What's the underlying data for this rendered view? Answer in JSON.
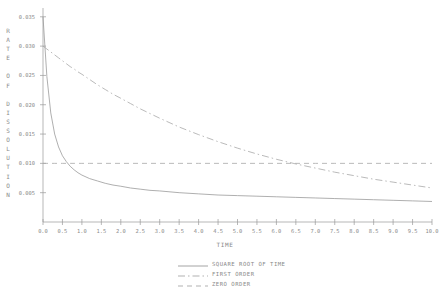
{
  "chart_data": {
    "type": "line",
    "title": "",
    "xlabel": "TIME",
    "ylabel": "RATE OF DISSOLUTION",
    "xlim": [
      0.0,
      10.0
    ],
    "ylim": [
      0.0,
      0.035
    ],
    "grid": false,
    "legend_position": "bottom-center",
    "xticks": [
      "0.0",
      "0.5",
      "1.0",
      "1.5",
      "2.0",
      "2.5",
      "3.0",
      "3.5",
      "4.0",
      "4.5",
      "5.0",
      "5.5",
      "6.0",
      "6.5",
      "7.0",
      "7.5",
      "8.0",
      "8.5",
      "9.0",
      "9.5",
      "10.0"
    ],
    "xtick_values": [
      0,
      0.5,
      1,
      1.5,
      2,
      2.5,
      3,
      3.5,
      4,
      4.5,
      5,
      5.5,
      6,
      6.5,
      7,
      7.5,
      8,
      8.5,
      9,
      9.5,
      10
    ],
    "yticks": [
      "0.035",
      "0.030",
      "0.025",
      "0.020",
      "0.015",
      "0.010",
      "0.005"
    ],
    "ytick_values": [
      0.035,
      0.03,
      0.025,
      0.02,
      0.015,
      0.01,
      0.005
    ],
    "x": [
      0.0,
      0.1,
      0.2,
      0.3,
      0.4,
      0.5,
      0.6,
      0.7,
      0.8,
      0.9,
      1.0,
      1.2,
      1.4,
      1.6,
      1.8,
      2.0,
      2.25,
      2.5,
      2.75,
      3.0,
      3.5,
      4.0,
      4.5,
      5.0,
      5.5,
      6.0,
      6.5,
      7.0,
      7.5,
      8.0,
      8.5,
      9.0,
      9.5,
      10.0
    ],
    "series": [
      {
        "name": "SQUARE ROOT OF TIME",
        "style": "solid",
        "color": "#9a9a9a",
        "values": [
          0.035,
          0.0248,
          0.0186,
          0.015,
          0.0128,
          0.0113,
          0.0103,
          0.0095,
          0.0089,
          0.0084,
          0.008,
          0.0074,
          0.007,
          0.0066,
          0.0063,
          0.0061,
          0.0058,
          0.0056,
          0.0054,
          0.0053,
          0.005,
          0.0048,
          0.0046,
          0.0045,
          0.0044,
          0.0043,
          0.0042,
          0.0041,
          0.004,
          0.0039,
          0.0038,
          0.0037,
          0.0036,
          0.0035
        ]
      },
      {
        "name": "FIRST ORDER",
        "style": "dashdot",
        "color": "#a8a8a8",
        "values": [
          0.03,
          0.0295,
          0.029,
          0.0285,
          0.028,
          0.0275,
          0.027,
          0.0265,
          0.0261,
          0.0256,
          0.0252,
          0.0243,
          0.0234,
          0.0226,
          0.0218,
          0.0211,
          0.0202,
          0.0193,
          0.0185,
          0.0177,
          0.0162,
          0.0149,
          0.0137,
          0.0126,
          0.0116,
          0.0107,
          0.0099,
          0.0092,
          0.0085,
          0.0079,
          0.0073,
          0.0068,
          0.0063,
          0.0058
        ]
      },
      {
        "name": "ZERO ORDER",
        "style": "dashed",
        "color": "#a8a8a8",
        "values": [
          0.01,
          0.01,
          0.01,
          0.01,
          0.01,
          0.01,
          0.01,
          0.01,
          0.01,
          0.01,
          0.01,
          0.01,
          0.01,
          0.01,
          0.01,
          0.01,
          0.01,
          0.01,
          0.01,
          0.01,
          0.01,
          0.01,
          0.01,
          0.01,
          0.01,
          0.01,
          0.01,
          0.01,
          0.01,
          0.01,
          0.01,
          0.01,
          0.01,
          0.01
        ]
      }
    ],
    "axis_color": "#9a9a9a"
  },
  "ylabel_letters": "R\nA\nT\nE\n\nO\nF\n\nD\nI\nS\nS\nO\nL\nU\nT\nI\nO\nN"
}
